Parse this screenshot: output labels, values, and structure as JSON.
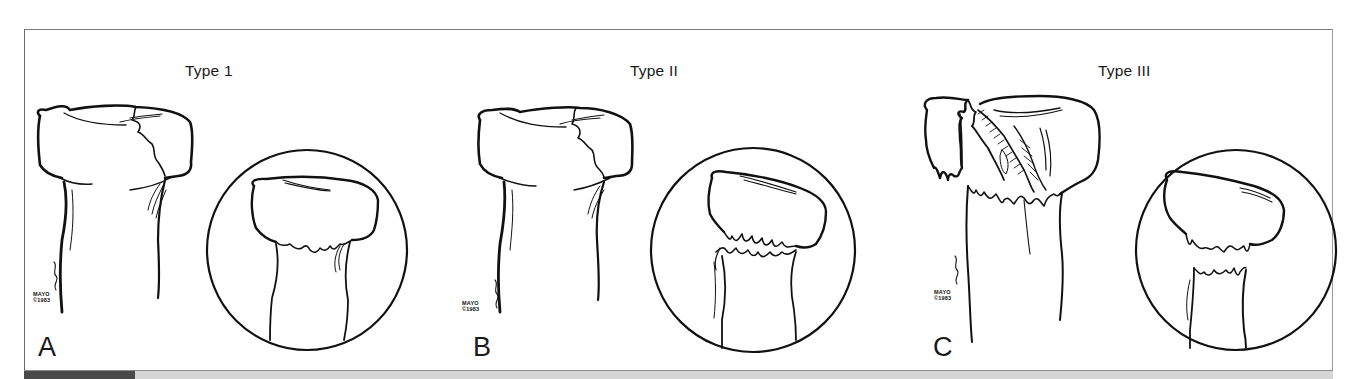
{
  "figure": {
    "panels": [
      {
        "id": "A",
        "title": "Type 1",
        "letter": "A",
        "signature": {
          "line1": "MAYO",
          "line2": "©1983"
        }
      },
      {
        "id": "B",
        "title": "Type II",
        "letter": "B",
        "signature": {
          "line1": "MAYO",
          "line2": "©1983"
        }
      },
      {
        "id": "C",
        "title": "Type III",
        "letter": "C",
        "signature": {
          "line1": "MAYO",
          "line2": "©1983"
        }
      }
    ],
    "colors": {
      "ink": "#111111",
      "frame": "#7a7a7a",
      "bar": "#d6d6d6",
      "bar_accent": "#4a4a4a",
      "background": "#ffffff"
    }
  }
}
